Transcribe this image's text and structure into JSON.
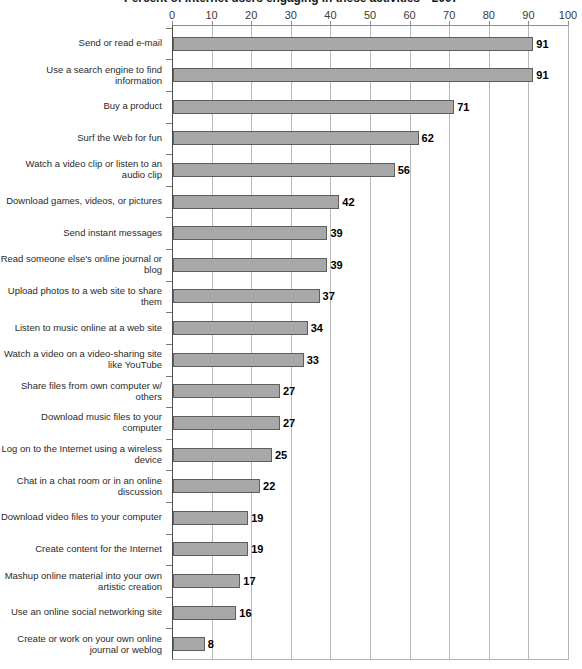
{
  "chart_data": {
    "type": "bar",
    "orientation": "horizontal",
    "title": "Percent of Internet users engaging in these activities—2007",
    "xlabel": "",
    "ylabel": "",
    "xlim": [
      0,
      100
    ],
    "xticks": [
      0,
      10,
      20,
      30,
      40,
      50,
      60,
      70,
      80,
      90,
      100
    ],
    "grid": "vertical",
    "legend": "none",
    "bar_color": "#a8a8a8",
    "bar_border_color": "#5e5e5e",
    "categories": [
      "Send or read e-mail",
      "Use a search engine to find information",
      "Buy a product",
      "Surf the Web for fun",
      "Watch a video clip or listen to  an audio clip",
      "Download games, videos, or pictures",
      "Send instant messages",
      "Read someone else's online journal or blog",
      "Upload photos to a web site to share them",
      "Listen to music online at a web site",
      "Watch a video on a video-sharing site like YouTube",
      "Share files from own computer w/ others",
      "Download music files to your computer",
      "Log on to the Internet using a wireless device",
      "Chat in a chat room or in an online discussion",
      "Download video files to your computer",
      "Create content for the Internet",
      "Mashup online material into your own artistic creation",
      "Use an online social networking site",
      "Create or work on your own online journal or weblog"
    ],
    "values": [
      91,
      91,
      71,
      62,
      56,
      42,
      39,
      39,
      37,
      34,
      33,
      27,
      27,
      25,
      22,
      19,
      19,
      17,
      16,
      8
    ],
    "value_labels": [
      "91",
      "91",
      "71",
      "62",
      "56",
      "42",
      "39",
      "39",
      "37",
      "34",
      "33",
      "27",
      "27",
      "25",
      "22",
      "19",
      "19",
      "17",
      "16",
      "8"
    ]
  }
}
